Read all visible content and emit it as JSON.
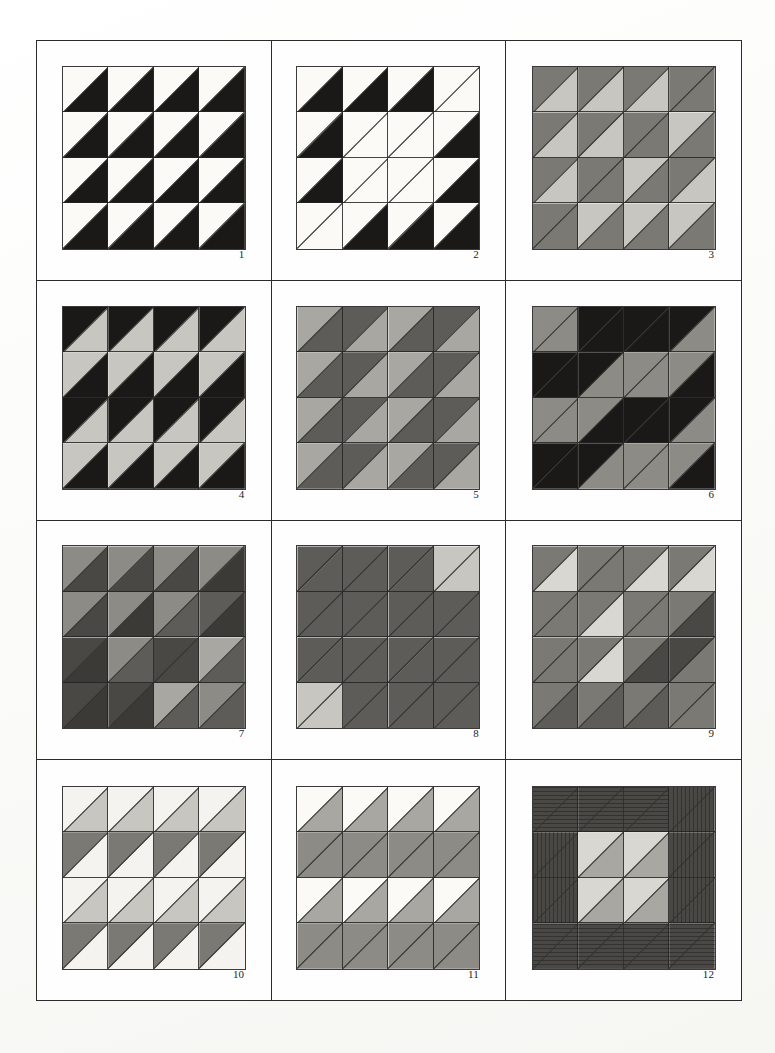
{
  "sheet": {
    "title": "Half-Square Triangle Pattern Study Sheet",
    "background_color": "#fdfdfb",
    "frame_color": "#2b2b2b",
    "grid_columns": 3,
    "grid_rows": 4,
    "motif_grid": "4x4"
  },
  "palette": {
    "white": "#fbfaf7",
    "near_white": "#f4f3ef",
    "light_gray": "#c8c6c0",
    "pale_gray": "#d9d7d1",
    "mid_light_gray": "#a9a7a1",
    "mid_gray": "#8d8b86",
    "gray": "#7b7974",
    "dark_gray": "#5e5c58",
    "darker_gray": "#4a4845",
    "charcoal": "#3c3a37",
    "black": "#1a1917",
    "pencil_line": "#2f2e2c"
  },
  "motifs": [
    {
      "number": "1",
      "tiles": [
        [
          "white",
          "black"
        ],
        [
          "white",
          "black"
        ],
        [
          "white",
          "black"
        ],
        [
          "white",
          "black"
        ],
        [
          "white",
          "black"
        ],
        [
          "white",
          "black"
        ],
        [
          "white",
          "black"
        ],
        [
          "white",
          "black"
        ],
        [
          "white",
          "black"
        ],
        [
          "white",
          "black"
        ],
        [
          "white",
          "black"
        ],
        [
          "white",
          "black"
        ],
        [
          "white",
          "black"
        ],
        [
          "white",
          "black"
        ],
        [
          "white",
          "black"
        ],
        [
          "white",
          "black"
        ]
      ]
    },
    {
      "number": "2",
      "tiles": [
        [
          "white",
          "black"
        ],
        [
          "white",
          "black"
        ],
        [
          "white",
          "black"
        ],
        [
          "white",
          "white"
        ],
        [
          "white",
          "black"
        ],
        [
          "white",
          "white"
        ],
        [
          "white",
          "white"
        ],
        [
          "white",
          "black"
        ],
        [
          "white",
          "black"
        ],
        [
          "white",
          "white"
        ],
        [
          "white",
          "white"
        ],
        [
          "white",
          "black"
        ],
        [
          "white",
          "white"
        ],
        [
          "white",
          "black"
        ],
        [
          "white",
          "black"
        ],
        [
          "white",
          "black"
        ]
      ]
    },
    {
      "number": "3",
      "tiles": [
        [
          "gray",
          "light_gray"
        ],
        [
          "gray",
          "light_gray"
        ],
        [
          "gray",
          "light_gray"
        ],
        [
          "gray",
          "gray"
        ],
        [
          "gray",
          "light_gray"
        ],
        [
          "gray",
          "light_gray"
        ],
        [
          "gray",
          "gray"
        ],
        [
          "light_gray",
          "gray"
        ],
        [
          "gray",
          "light_gray"
        ],
        [
          "gray",
          "gray"
        ],
        [
          "light_gray",
          "gray"
        ],
        [
          "gray",
          "light_gray"
        ],
        [
          "gray",
          "gray"
        ],
        [
          "light_gray",
          "gray"
        ],
        [
          "light_gray",
          "gray"
        ],
        [
          "light_gray",
          "gray"
        ]
      ]
    },
    {
      "number": "4",
      "tiles": [
        [
          "black",
          "light_gray"
        ],
        [
          "black",
          "light_gray"
        ],
        [
          "black",
          "light_gray"
        ],
        [
          "black",
          "light_gray"
        ],
        [
          "light_gray",
          "black"
        ],
        [
          "light_gray",
          "black"
        ],
        [
          "light_gray",
          "black"
        ],
        [
          "light_gray",
          "black"
        ],
        [
          "black",
          "light_gray"
        ],
        [
          "black",
          "light_gray"
        ],
        [
          "black",
          "light_gray"
        ],
        [
          "black",
          "light_gray"
        ],
        [
          "light_gray",
          "black"
        ],
        [
          "light_gray",
          "black"
        ],
        [
          "light_gray",
          "black"
        ],
        [
          "light_gray",
          "black"
        ]
      ]
    },
    {
      "number": "5",
      "tiles": [
        [
          "mid_light_gray",
          "dark_gray"
        ],
        [
          "dark_gray",
          "mid_light_gray"
        ],
        [
          "mid_light_gray",
          "dark_gray"
        ],
        [
          "dark_gray",
          "mid_light_gray"
        ],
        [
          "mid_light_gray",
          "dark_gray"
        ],
        [
          "dark_gray",
          "mid_light_gray"
        ],
        [
          "mid_light_gray",
          "dark_gray"
        ],
        [
          "dark_gray",
          "mid_light_gray"
        ],
        [
          "mid_light_gray",
          "dark_gray"
        ],
        [
          "dark_gray",
          "mid_light_gray"
        ],
        [
          "mid_light_gray",
          "dark_gray"
        ],
        [
          "dark_gray",
          "mid_light_gray"
        ],
        [
          "mid_light_gray",
          "dark_gray"
        ],
        [
          "dark_gray",
          "mid_light_gray"
        ],
        [
          "mid_light_gray",
          "dark_gray"
        ],
        [
          "dark_gray",
          "mid_light_gray"
        ]
      ]
    },
    {
      "number": "6",
      "tiles": [
        [
          "mid_gray",
          "mid_gray"
        ],
        [
          "black",
          "black"
        ],
        [
          "black",
          "black"
        ],
        [
          "black",
          "mid_gray"
        ],
        [
          "black",
          "black"
        ],
        [
          "black",
          "mid_gray"
        ],
        [
          "mid_gray",
          "mid_gray"
        ],
        [
          "mid_gray",
          "black"
        ],
        [
          "mid_gray",
          "mid_gray"
        ],
        [
          "mid_gray",
          "black"
        ],
        [
          "black",
          "black"
        ],
        [
          "black",
          "mid_gray"
        ],
        [
          "black",
          "black"
        ],
        [
          "black",
          "mid_gray"
        ],
        [
          "mid_gray",
          "mid_gray"
        ],
        [
          "mid_gray",
          "black"
        ]
      ]
    },
    {
      "number": "7",
      "tiles": [
        [
          "mid_gray",
          "darker_gray"
        ],
        [
          "mid_gray",
          "darker_gray"
        ],
        [
          "mid_gray",
          "darker_gray"
        ],
        [
          "mid_gray",
          "charcoal"
        ],
        [
          "mid_gray",
          "darker_gray"
        ],
        [
          "mid_gray",
          "charcoal"
        ],
        [
          "mid_gray",
          "dark_gray"
        ],
        [
          "dark_gray",
          "charcoal"
        ],
        [
          "darker_gray",
          "charcoal"
        ],
        [
          "mid_gray",
          "dark_gray"
        ],
        [
          "darker_gray",
          "darker_gray"
        ],
        [
          "mid_light_gray",
          "dark_gray"
        ],
        [
          "darker_gray",
          "charcoal"
        ],
        [
          "darker_gray",
          "charcoal"
        ],
        [
          "mid_light_gray",
          "dark_gray"
        ],
        [
          "mid_gray",
          "dark_gray"
        ]
      ]
    },
    {
      "number": "8",
      "tiles": [
        [
          "dark_gray",
          "dark_gray"
        ],
        [
          "dark_gray",
          "dark_gray"
        ],
        [
          "dark_gray",
          "dark_gray"
        ],
        [
          "light_gray",
          "light_gray"
        ],
        [
          "dark_gray",
          "dark_gray"
        ],
        [
          "dark_gray",
          "dark_gray"
        ],
        [
          "dark_gray",
          "dark_gray"
        ],
        [
          "dark_gray",
          "dark_gray"
        ],
        [
          "dark_gray",
          "dark_gray"
        ],
        [
          "dark_gray",
          "dark_gray"
        ],
        [
          "dark_gray",
          "dark_gray"
        ],
        [
          "dark_gray",
          "dark_gray"
        ],
        [
          "light_gray",
          "light_gray"
        ],
        [
          "dark_gray",
          "dark_gray"
        ],
        [
          "dark_gray",
          "dark_gray"
        ],
        [
          "dark_gray",
          "dark_gray"
        ]
      ]
    },
    {
      "number": "9",
      "tiles": [
        [
          "gray",
          "pale_gray"
        ],
        [
          "gray",
          "gray"
        ],
        [
          "gray",
          "pale_gray"
        ],
        [
          "gray",
          "pale_gray"
        ],
        [
          "gray",
          "gray"
        ],
        [
          "gray",
          "pale_gray"
        ],
        [
          "gray",
          "gray"
        ],
        [
          "gray",
          "darker_gray"
        ],
        [
          "gray",
          "gray"
        ],
        [
          "gray",
          "pale_gray"
        ],
        [
          "gray",
          "darker_gray"
        ],
        [
          "darker_gray",
          "gray"
        ],
        [
          "gray",
          "dark_gray"
        ],
        [
          "gray",
          "dark_gray"
        ],
        [
          "gray",
          "dark_gray"
        ],
        [
          "gray",
          "gray"
        ]
      ]
    },
    {
      "number": "10",
      "tiles": [
        [
          "near_white",
          "light_gray"
        ],
        [
          "near_white",
          "light_gray"
        ],
        [
          "near_white",
          "light_gray"
        ],
        [
          "near_white",
          "light_gray"
        ],
        [
          "gray",
          "near_white"
        ],
        [
          "gray",
          "near_white"
        ],
        [
          "gray",
          "near_white"
        ],
        [
          "gray",
          "near_white"
        ],
        [
          "near_white",
          "light_gray"
        ],
        [
          "near_white",
          "light_gray"
        ],
        [
          "near_white",
          "light_gray"
        ],
        [
          "near_white",
          "light_gray"
        ],
        [
          "gray",
          "near_white"
        ],
        [
          "gray",
          "near_white"
        ],
        [
          "gray",
          "near_white"
        ],
        [
          "gray",
          "near_white"
        ]
      ]
    },
    {
      "number": "11",
      "tiles": [
        [
          "white",
          "mid_light_gray"
        ],
        [
          "white",
          "mid_light_gray"
        ],
        [
          "white",
          "mid_light_gray"
        ],
        [
          "white",
          "mid_light_gray"
        ],
        [
          "mid_gray",
          "mid_gray"
        ],
        [
          "mid_gray",
          "mid_gray"
        ],
        [
          "mid_gray",
          "mid_gray"
        ],
        [
          "mid_gray",
          "mid_gray"
        ],
        [
          "white",
          "mid_light_gray"
        ],
        [
          "white",
          "mid_light_gray"
        ],
        [
          "white",
          "mid_light_gray"
        ],
        [
          "white",
          "mid_light_gray"
        ],
        [
          "mid_gray",
          "mid_gray"
        ],
        [
          "mid_gray",
          "mid_gray"
        ],
        [
          "mid_gray",
          "mid_gray"
        ],
        [
          "mid_gray",
          "mid_gray"
        ]
      ]
    },
    {
      "number": "12",
      "tiles": [
        [
          "darker_gray",
          "darker_gray"
        ],
        [
          "darker_gray",
          "darker_gray"
        ],
        [
          "darker_gray",
          "darker_gray"
        ],
        [
          "darker_gray",
          "darker_gray"
        ],
        [
          "darker_gray",
          "darker_gray"
        ],
        [
          "pale_gray",
          "mid_light_gray"
        ],
        [
          "pale_gray",
          "mid_light_gray"
        ],
        [
          "darker_gray",
          "darker_gray"
        ],
        [
          "darker_gray",
          "darker_gray"
        ],
        [
          "pale_gray",
          "mid_light_gray"
        ],
        [
          "pale_gray",
          "mid_light_gray"
        ],
        [
          "darker_gray",
          "darker_gray"
        ],
        [
          "darker_gray",
          "darker_gray"
        ],
        [
          "darker_gray",
          "darker_gray"
        ],
        [
          "darker_gray",
          "darker_gray"
        ],
        [
          "darker_gray",
          "darker_gray"
        ]
      ],
      "hatching": [
        "h",
        "h",
        "h",
        "v",
        "v",
        "",
        "",
        "v",
        "v",
        "",
        "",
        "v",
        "h",
        "h",
        "h",
        "h"
      ]
    }
  ]
}
